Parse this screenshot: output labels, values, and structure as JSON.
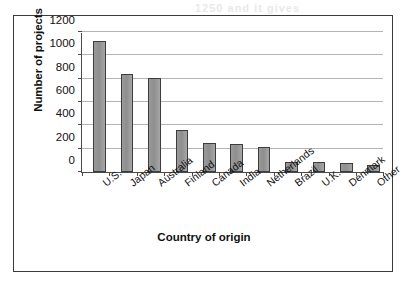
{
  "chart_data": {
    "type": "bar",
    "title": "",
    "xlabel": "Country of origin",
    "ylabel": "Number of projects",
    "categories": [
      "U.S.",
      "Japan",
      "Australia",
      "Finland",
      "Canada",
      "India",
      "Netherlands",
      "Brazil",
      "U.K.",
      "Denmark",
      "Other"
    ],
    "values": [
      1120,
      840,
      805,
      360,
      245,
      238,
      212,
      90,
      83,
      74,
      64
    ],
    "ylim": [
      0,
      1200
    ],
    "ytick_labels": [
      "0",
      "200",
      "400",
      "600",
      "800",
      "1000",
      "1200"
    ],
    "ytick_values": [
      0,
      200,
      400,
      600,
      800,
      1000,
      1200
    ],
    "grid": true,
    "legend": "none",
    "bar_color": "#989898",
    "bar_edge_color": "#3c3c3c",
    "gridline_color": "#b4b4b4",
    "axis_color": "#4a4a4a",
    "frame_color": "#3a3a3a",
    "background": "#ffffff"
  },
  "scan_artifacts": {
    "line1": "1250 and it gives",
    "line2": "of the",
    "line3": "",
    "line4": "",
    "line5": "",
    "line6": "",
    "line7": "",
    "line8": ""
  }
}
